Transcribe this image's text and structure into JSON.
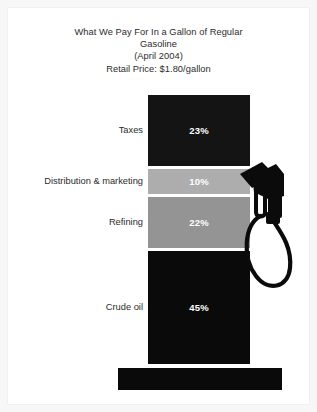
{
  "chart_data": {
    "type": "bar",
    "subtype": "stacked-single-column",
    "title": "What We Pay For In a Gallon of Regular Gasoline",
    "title_lines": [
      "What We Pay For In a Gallon of Regular",
      "Gasoline",
      "(April 2004)",
      "Retail Price: $1.80/gallon"
    ],
    "subtitle": "(April 2004)",
    "annotation": "Retail Price: $1.80/gallon",
    "xlabel": "",
    "ylabel": "",
    "ylim": [
      0,
      100
    ],
    "grid": false,
    "legend": false,
    "categories": [
      "Taxes",
      "Distribution & marketing",
      "Refining",
      "Crude oil"
    ],
    "values": [
      23,
      10,
      22,
      45
    ],
    "value_labels": [
      "23%",
      "10%",
      "22%",
      "45%"
    ],
    "colors": [
      "#141414",
      "#adadad",
      "#949494",
      "#0a0a0a"
    ],
    "segments": [
      {
        "label": "Taxes",
        "value": 23,
        "value_label": "23%",
        "color": "#141414",
        "top": 87,
        "height": 71
      },
      {
        "label": "Distribution & marketing",
        "value": 10,
        "value_label": "10%",
        "color": "#adadad",
        "top": 161,
        "height": 25
      },
      {
        "label": "Refining",
        "value": 22,
        "value_label": "22%",
        "color": "#949494",
        "top": 189,
        "height": 51
      },
      {
        "label": "Crude oil",
        "value": 45,
        "value_label": "45%",
        "color": "#0a0a0a",
        "top": 243,
        "height": 113
      }
    ]
  },
  "figure": {
    "background": "#ffffff",
    "page_background": "#f7f7f7",
    "text_color": "#2b2b2b",
    "value_text_color": "#ffffff"
  },
  "icons": {
    "nozzle": "fuel-nozzle-icon",
    "base": "pump-base-icon"
  }
}
